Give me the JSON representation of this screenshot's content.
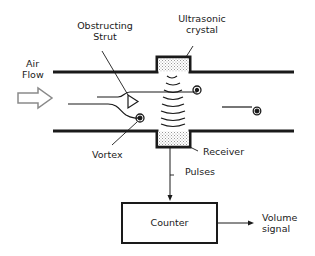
{
  "diagram": {
    "labels": {
      "air_flow_line1": "Air",
      "air_flow_line2": "Flow",
      "strut_line1": "Obstructing",
      "strut_line2": "Strut",
      "crystal_line1": "Ultrasonic",
      "crystal_line2": "crystal",
      "vortex": "Vortex",
      "receiver": "Receiver",
      "pulses": "Pulses",
      "counter": "Counter",
      "volume_line1": "Volume",
      "volume_line2": "signal"
    },
    "colors": {
      "line": "#1a1a1a",
      "arrow_outline": "#8a8a8a",
      "stipple": "#b5b5b5",
      "background": "#ffffff"
    }
  }
}
